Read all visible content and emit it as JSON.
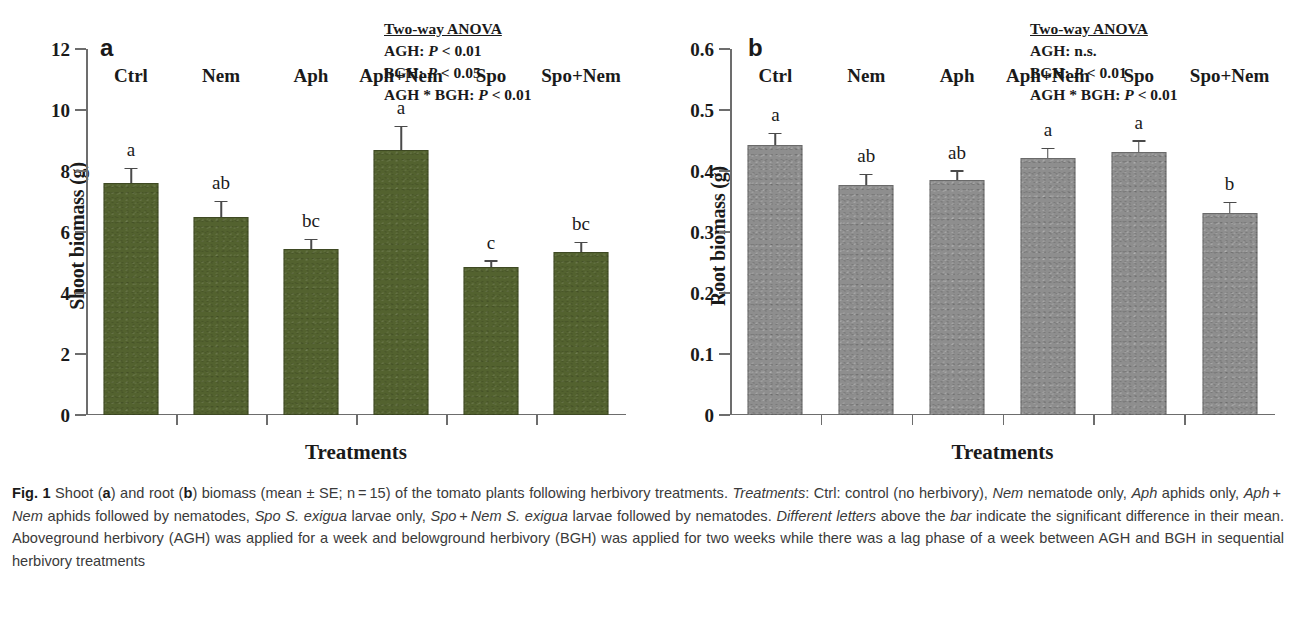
{
  "figure": {
    "label": "Fig. 1",
    "caption_html": "Shoot (<b>a</b>) and root (<b>b</b>) biomass (mean &plusmn; SE; n&thinsp;=&thinsp;15) of the tomato plants following herbivory treatments. <i>Treatments</i>: Ctrl: control (no herbivory), <i>Nem</i> nematode only, <i>Aph</i> aphids only, <i>Aph</i>&thinsp;+&thinsp;<i>Nem</i> aphids followed by nematodes, <i>Spo</i> <i>S. exigua</i> larvae only, <i>Spo</i>&thinsp;+&thinsp;<i>Nem</i> <i>S. exigua</i> larvae followed by nematodes. <i>Different letters</i> above the <i>bar</i> indicate the significant difference in their mean. Aboveground herbivory (AGH) was applied for a week and belowground herbivory (BGH) was applied for two weeks while there was a lag phase of a week between AGH and BGH in sequential herbivory treatments"
  },
  "colors": {
    "shoot_bar": "#53622f",
    "root_bar": "#8e8e8e",
    "axis": "#6d6d6d",
    "error_bar": "#4a4a4a"
  },
  "chart_data": [
    {
      "type": "bar",
      "panel": "a",
      "title": "a",
      "xlabel": "Treatments",
      "ylabel": "Shoot biomass (g)",
      "ylim": [
        0,
        12
      ],
      "yticks": [
        0,
        2,
        4,
        6,
        8,
        10,
        12
      ],
      "ytick_labels": [
        "0",
        "2",
        "4",
        "6",
        "8",
        "10",
        "12"
      ],
      "grid": false,
      "legend": "none",
      "bar_color": "#53622f",
      "categories": [
        "Ctrl",
        "Nem",
        "Aph",
        "Aph+Nem",
        "Spo",
        "Spo+Nem"
      ],
      "values": [
        7.6,
        6.5,
        5.45,
        8.7,
        4.85,
        5.35
      ],
      "errors": [
        0.45,
        0.48,
        0.28,
        0.73,
        0.17,
        0.28
      ],
      "sig_letters": [
        "a",
        "ab",
        "bc",
        "a",
        "c",
        "bc"
      ],
      "stats": {
        "header": "Two-way ANOVA",
        "lines": [
          {
            "factor": "AGH:",
            "value": "P",
            "rest": " < 0.01"
          },
          {
            "factor": "BGH:",
            "value": "P",
            "rest": " < 0.05"
          },
          {
            "factor": "AGH * BGH:",
            "value": "P",
            "rest": " < 0.01"
          }
        ]
      }
    },
    {
      "type": "bar",
      "panel": "b",
      "title": "b",
      "xlabel": "Treatments",
      "ylabel": "Root biomass (g)",
      "ylim": [
        0,
        0.6
      ],
      "yticks": [
        0,
        0.1,
        0.2,
        0.3,
        0.4,
        0.5,
        0.6
      ],
      "ytick_labels": [
        "0",
        "0.1",
        "0.2",
        "0.3",
        "0.4",
        "0.5",
        "0.6"
      ],
      "grid": false,
      "legend": "none",
      "bar_color": "#8e8e8e",
      "categories": [
        "Ctrl",
        "Nem",
        "Aph",
        "Aph+Nem",
        "Spo",
        "Spo+Nem"
      ],
      "values": [
        0.442,
        0.377,
        0.385,
        0.421,
        0.431,
        0.331
      ],
      "errors": [
        0.018,
        0.016,
        0.014,
        0.015,
        0.017,
        0.016
      ],
      "sig_letters": [
        "a",
        "ab",
        "ab",
        "a",
        "a",
        "b"
      ],
      "stats": {
        "header": "Two-way ANOVA",
        "lines": [
          {
            "factor": "AGH:",
            "value": "",
            "rest": " n.s."
          },
          {
            "factor": "BGH:",
            "value": "P",
            "rest": " < 0.01"
          },
          {
            "factor": "AGH * BGH:",
            "value": "P",
            "rest": " < 0.01"
          }
        ]
      }
    }
  ]
}
